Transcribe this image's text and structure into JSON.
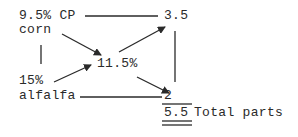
{
  "diagram": {
    "type": "pearson-square",
    "nodes": {
      "corn_cp": "9.5% CP",
      "corn": "corn",
      "alfalfa_pct": "15%",
      "alfalfa": "alfalfa",
      "target": "11.5%",
      "corn_parts": "3.5",
      "alfalfa_parts": "2",
      "total_value": "5.5",
      "total_label": "Total parts"
    },
    "colors": {
      "ink": "#2a2a2a",
      "background": "#ffffff"
    }
  }
}
